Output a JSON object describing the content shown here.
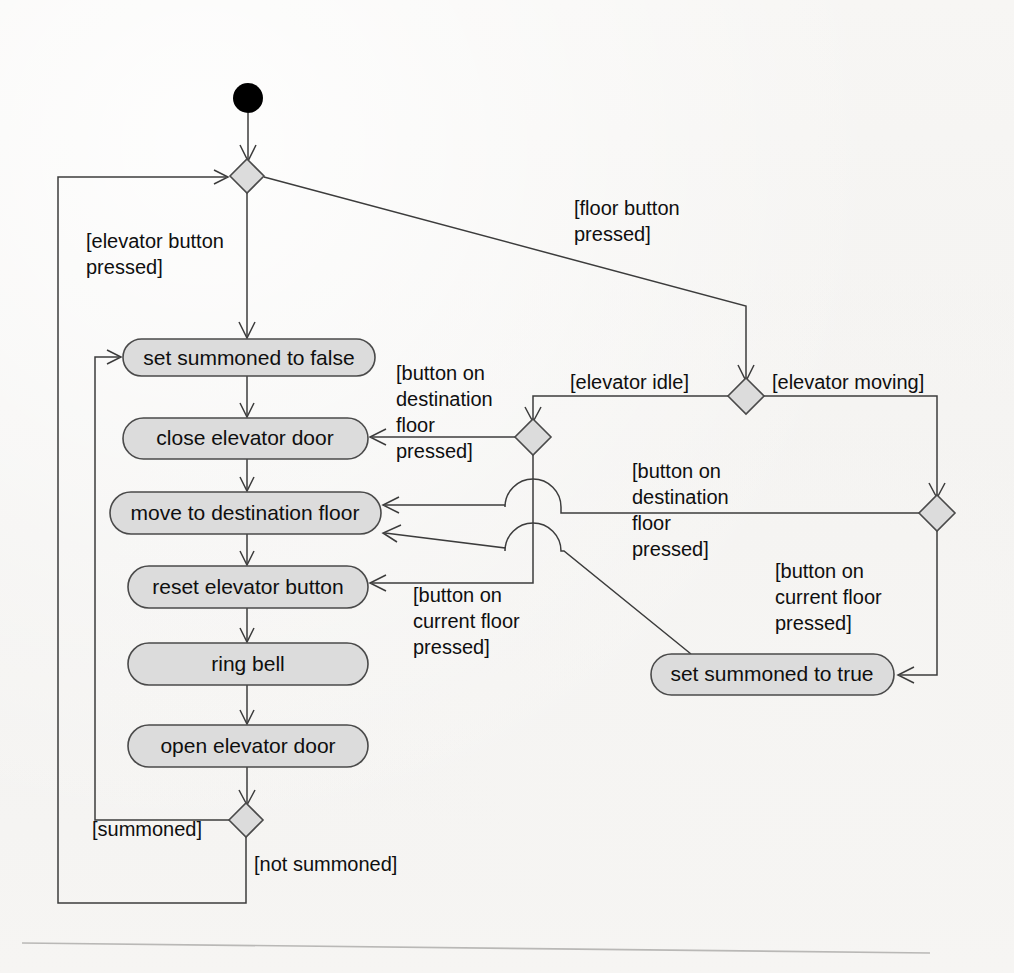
{
  "diagram": {
    "type": "uml-activity-diagram",
    "background_color": "#f4f3f1",
    "node_fill_color": "#dcdcdc",
    "node_stroke_color": "#4a4a4a",
    "flow_color": "#3c3c3c",
    "start_node_color": "#000000"
  },
  "nodes": {
    "start": {
      "name": "start-node",
      "cx": 248,
      "cy": 98,
      "r": 15
    },
    "activities": [
      {
        "id": "set-summoned-false",
        "label": "set summoned to false",
        "x": 123,
        "y": 339,
        "w": 252,
        "h": 37
      },
      {
        "id": "close-elevator-door",
        "label": "close elevator door",
        "x": 123,
        "y": 418,
        "w": 245,
        "h": 41
      },
      {
        "id": "move-to-destination-floor",
        "label": "move to destination floor",
        "x": 110,
        "y": 492,
        "w": 271,
        "h": 42
      },
      {
        "id": "reset-elevator-button",
        "label": "reset elevator button",
        "x": 128,
        "y": 566,
        "w": 240,
        "h": 42
      },
      {
        "id": "ring-bell",
        "label": "ring bell",
        "x": 128,
        "y": 643,
        "w": 240,
        "h": 42
      },
      {
        "id": "open-elevator-door",
        "label": "open elevator door",
        "x": 128,
        "y": 725,
        "w": 240,
        "h": 42
      },
      {
        "id": "set-summoned-true",
        "label": "set summoned to true",
        "x": 651,
        "y": 654,
        "w": 243,
        "h": 41
      }
    ],
    "decisions": [
      {
        "id": "decision-entry",
        "cx": 247,
        "cy": 176,
        "rx": 17,
        "ry": 17
      },
      {
        "id": "decision-elevator-state",
        "cx": 746,
        "cy": 396,
        "rx": 18,
        "ry": 18
      },
      {
        "id": "decision-idle-branch",
        "cx": 533,
        "cy": 437,
        "rx": 18,
        "ry": 18
      },
      {
        "id": "decision-moving-branch",
        "cx": 937,
        "cy": 513,
        "rx": 18,
        "ry": 18
      },
      {
        "id": "decision-summoned",
        "cx": 246,
        "cy": 820,
        "rx": 17,
        "ry": 17
      }
    ]
  },
  "guards": [
    {
      "id": "guard-elevator-button-pressed",
      "lines": [
        "[elevator button",
        "pressed]"
      ],
      "x": 86,
      "y": 232
    },
    {
      "id": "guard-floor-button-pressed",
      "lines": [
        "[floor button",
        "pressed]"
      ],
      "x": 574,
      "y": 199
    },
    {
      "id": "guard-elevator-idle",
      "lines": [
        "[elevator idle]"
      ],
      "x": 570,
      "y": 373
    },
    {
      "id": "guard-elevator-moving",
      "lines": [
        "[elevator moving]"
      ],
      "x": 772,
      "y": 373
    },
    {
      "id": "guard-button-destination-left",
      "lines": [
        "[button on",
        "destination",
        "floor",
        "pressed]"
      ],
      "x": 396,
      "y": 364
    },
    {
      "id": "guard-button-destination-right",
      "lines": [
        "[button on",
        "destination",
        "floor",
        "pressed]"
      ],
      "x": 632,
      "y": 462
    },
    {
      "id": "guard-button-current-floor-left",
      "lines": [
        "[button on",
        "current floor",
        "pressed]"
      ],
      "x": 413,
      "y": 586
    },
    {
      "id": "guard-button-current-floor-right",
      "lines": [
        "[button on",
        "current floor",
        "pressed]"
      ],
      "x": 775,
      "y": 562
    },
    {
      "id": "guard-summoned",
      "lines": [
        "[summoned]"
      ],
      "x": 92,
      "y": 820
    },
    {
      "id": "guard-not-summoned",
      "lines": [
        "[not summoned]"
      ],
      "x": 254,
      "y": 855
    }
  ],
  "flows": [
    {
      "id": "flow-start-to-entry",
      "from": "start",
      "to": "decision-entry"
    },
    {
      "id": "flow-entry-to-set-false",
      "from": "decision-entry",
      "to": "set-summoned-false",
      "guard": "[elevator button pressed]"
    },
    {
      "id": "flow-entry-to-elevator-state",
      "from": "decision-entry",
      "to": "decision-elevator-state",
      "guard": "[floor button pressed]"
    },
    {
      "id": "flow-set-false-to-close-door",
      "from": "set-summoned-false",
      "to": "close-elevator-door"
    },
    {
      "id": "flow-close-door-to-move",
      "from": "close-elevator-door",
      "to": "move-to-destination-floor"
    },
    {
      "id": "flow-move-to-reset",
      "from": "move-to-destination-floor",
      "to": "reset-elevator-button"
    },
    {
      "id": "flow-reset-to-ring-bell",
      "from": "reset-elevator-button",
      "to": "ring-bell"
    },
    {
      "id": "flow-ring-bell-to-open-door",
      "from": "ring-bell",
      "to": "open-elevator-door"
    },
    {
      "id": "flow-open-door-to-summoned-decision",
      "from": "open-elevator-door",
      "to": "decision-summoned"
    },
    {
      "id": "flow-summoned-loop",
      "from": "decision-summoned",
      "to": "set-summoned-false",
      "guard": "[summoned]"
    },
    {
      "id": "flow-not-summoned-loop",
      "from": "decision-summoned",
      "to": "decision-entry",
      "guard": "[not summoned]"
    },
    {
      "id": "flow-idle-to-branch",
      "from": "decision-elevator-state",
      "to": "decision-idle-branch",
      "guard": "[elevator idle]"
    },
    {
      "id": "flow-moving-to-branch",
      "from": "decision-elevator-state",
      "to": "decision-moving-branch",
      "guard": "[elevator moving]"
    },
    {
      "id": "flow-idle-destination-to-close-door",
      "from": "decision-idle-branch",
      "to": "close-elevator-door",
      "guard": "[button on destination floor pressed]"
    },
    {
      "id": "flow-idle-current-to-reset",
      "from": "decision-idle-branch",
      "to": "reset-elevator-button",
      "guard": "[button on current floor pressed]"
    },
    {
      "id": "flow-moving-destination-to-move",
      "from": "decision-moving-branch",
      "to": "move-to-destination-floor",
      "guard": "[button on destination floor pressed]"
    },
    {
      "id": "flow-moving-current-to-set-true",
      "from": "decision-moving-branch",
      "to": "set-summoned-true",
      "guard": "[button on current floor pressed]"
    },
    {
      "id": "flow-set-true-to-move",
      "from": "set-summoned-true",
      "to": "move-to-destination-floor"
    }
  ]
}
